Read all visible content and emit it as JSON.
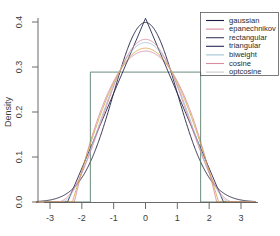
{
  "chart_data": {
    "type": "line",
    "title": "",
    "subtitle": "",
    "xlabel": "",
    "ylabel": "Density",
    "xlim": [
      -3.45,
      3.45
    ],
    "ylim": [
      0.0,
      0.41
    ],
    "xticks": [
      -3,
      -2,
      -1,
      0,
      1,
      2,
      3
    ],
    "xticklabels": [
      "-3",
      "-2",
      "-1",
      "0",
      "1",
      "2",
      "3"
    ],
    "yticks": [
      0.0,
      0.1,
      0.2,
      0.3,
      0.4
    ],
    "yticklabels": [
      "0.0",
      "0.1",
      "0.2",
      "0.3",
      "0.4"
    ],
    "grid": false,
    "legend_position": "top-right",
    "series": [
      {
        "name": "gaussian",
        "color": "#1c1c3c",
        "kernel": "gaussian",
        "bandwidth": 1.0,
        "peak": 0.399,
        "support": [
          -3.45,
          3.45
        ]
      },
      {
        "name": "epanechnikov",
        "color": "#d98ca0",
        "kernel": "epanechnikov",
        "bandwidth": 2.236,
        "peak": 0.335,
        "support": [
          -2.236,
          2.236
        ]
      },
      {
        "name": "rectangular",
        "color": "#5a7f6e",
        "kernel": "rectangular",
        "bandwidth": 1.732,
        "peak": 0.289,
        "support": [
          -1.732,
          1.732
        ]
      },
      {
        "name": "triangular",
        "color": "#2a2a55",
        "kernel": "triangular",
        "bandwidth": 2.449,
        "peak": 0.408,
        "support": [
          -2.449,
          2.449
        ]
      },
      {
        "name": "biweight",
        "color": "#9fc4d4",
        "kernel": "biweight",
        "bandwidth": 2.646,
        "peak": 0.354,
        "support": [
          -2.646,
          2.646
        ]
      },
      {
        "name": "cosine",
        "color": "#d98ca0",
        "kernel": "cosine",
        "bandwidth": 2.449,
        "peak": 0.347,
        "support": [
          -2.449,
          2.449
        ]
      },
      {
        "name": "optcosine",
        "color": "#d9a54a",
        "kernel": "optcosine",
        "bandwidth": 2.221,
        "peak": 0.353,
        "support": [
          -2.221,
          2.221
        ]
      }
    ]
  },
  "legend": {
    "entries": [
      {
        "label": "gaussian",
        "color": "#1c1c3c"
      },
      {
        "label": "epanechnikov",
        "color": "#d98ca0"
      },
      {
        "label": "rectangular",
        "color": "#3a3a5c"
      },
      {
        "label": "triangular",
        "color": "#2a2a55"
      },
      {
        "label": "biweight",
        "color": "#9fc4d4"
      },
      {
        "label": "cosine",
        "color": "#d98ca0"
      },
      {
        "label": "optcosine",
        "color": "#c9c9cf"
      }
    ]
  },
  "axes": {
    "ylabel": "Density",
    "xticklabels": [
      "-3",
      "-2",
      "-1",
      "0",
      "1",
      "2",
      "3"
    ],
    "yticklabels": [
      "0.0",
      "0.1",
      "0.2",
      "0.3",
      "0.4"
    ]
  }
}
